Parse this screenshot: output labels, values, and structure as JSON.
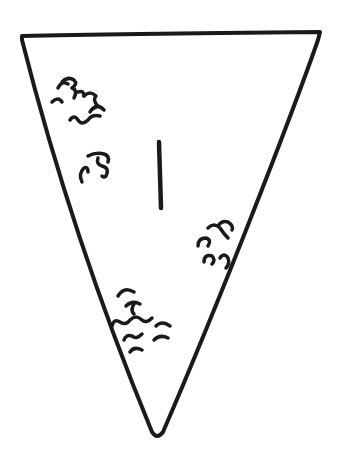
{
  "figure": {
    "type": "hand-drawn sketch",
    "caption_partial": "",
    "shape": "inverted-triangle",
    "label": "1",
    "ink_color": "#1a1a1a",
    "background": "#ffffff",
    "triangle": {
      "top_left": [
        21,
        35
      ],
      "top_right": [
        321,
        33
      ],
      "bottom": [
        157,
        437
      ]
    },
    "squiggle_clusters": [
      {
        "name": "upper-left-cluster",
        "center": [
          75,
          100
        ]
      },
      {
        "name": "middle-left-cluster",
        "center": [
          95,
          165
        ]
      },
      {
        "name": "right-cluster",
        "center": [
          215,
          245
        ]
      },
      {
        "name": "lower-cluster",
        "center": [
          135,
          325
        ]
      }
    ]
  }
}
